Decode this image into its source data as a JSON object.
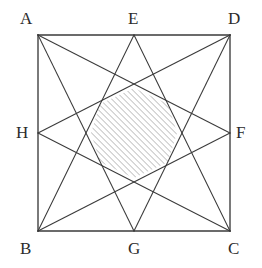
{
  "figure": {
    "stroke_color": "#3a3a3a",
    "hatch_color": "#9a9a9a",
    "background_color": "#ffffff",
    "label_color": "#2b2b2b",
    "square": {
      "name": "ABCD",
      "left": 38,
      "top": 35,
      "right": 230,
      "bottom": 231
    },
    "points": [
      {
        "id": "A",
        "label": "A",
        "role": "corner-top-left",
        "x": 38,
        "y": 35,
        "label_x": 20,
        "label_y": 10
      },
      {
        "id": "D",
        "label": "D",
        "role": "corner-top-right",
        "x": 230,
        "y": 35,
        "label_x": 228,
        "label_y": 10
      },
      {
        "id": "B",
        "label": "B",
        "role": "corner-bottom-left",
        "x": 38,
        "y": 231,
        "label_x": 20,
        "label_y": 240
      },
      {
        "id": "C",
        "label": "C",
        "role": "corner-bottom-right",
        "x": 230,
        "y": 231,
        "label_x": 228,
        "label_y": 240
      },
      {
        "id": "E",
        "label": "E",
        "role": "midpoint-top",
        "x": 134,
        "y": 35,
        "label_x": 128,
        "label_y": 10
      },
      {
        "id": "F",
        "label": "F",
        "role": "midpoint-right",
        "x": 230,
        "y": 133,
        "label_x": 236,
        "label_y": 124
      },
      {
        "id": "G",
        "label": "G",
        "role": "midpoint-bottom",
        "x": 134,
        "y": 231,
        "label_x": 128,
        "label_y": 240
      },
      {
        "id": "H",
        "label": "H",
        "role": "midpoint-left",
        "x": 38,
        "y": 133,
        "label_x": 16,
        "label_y": 124
      }
    ],
    "square_edges": [
      {
        "id": "AD",
        "from": "A",
        "to": "D"
      },
      {
        "id": "DC",
        "from": "D",
        "to": "C"
      },
      {
        "id": "CB",
        "from": "C",
        "to": "B"
      },
      {
        "id": "BA",
        "from": "B",
        "to": "A"
      }
    ],
    "star_lines": [
      {
        "id": "AF",
        "from": "A",
        "to": "F"
      },
      {
        "id": "AG",
        "from": "A",
        "to": "G"
      },
      {
        "id": "BE",
        "from": "B",
        "to": "E"
      },
      {
        "id": "BF",
        "from": "B",
        "to": "F"
      },
      {
        "id": "CE",
        "from": "C",
        "to": "E"
      },
      {
        "id": "CH",
        "from": "C",
        "to": "H"
      },
      {
        "id": "DG",
        "from": "D",
        "to": "G"
      },
      {
        "id": "DH",
        "from": "D",
        "to": "H"
      }
    ],
    "shaded_region": {
      "name": "central-octagon",
      "fill": "diagonal-hatch",
      "hatch_angle_deg": 45,
      "hatch_spacing_px": 3,
      "vertices": [
        {
          "x": 134,
          "y": 88
        },
        {
          "x": 168,
          "y": 104
        },
        {
          "x": 177,
          "y": 133
        },
        {
          "x": 168,
          "y": 162
        },
        {
          "x": 134,
          "y": 178
        },
        {
          "x": 100,
          "y": 162
        },
        {
          "x": 91,
          "y": 133
        },
        {
          "x": 100,
          "y": 104
        }
      ]
    }
  }
}
